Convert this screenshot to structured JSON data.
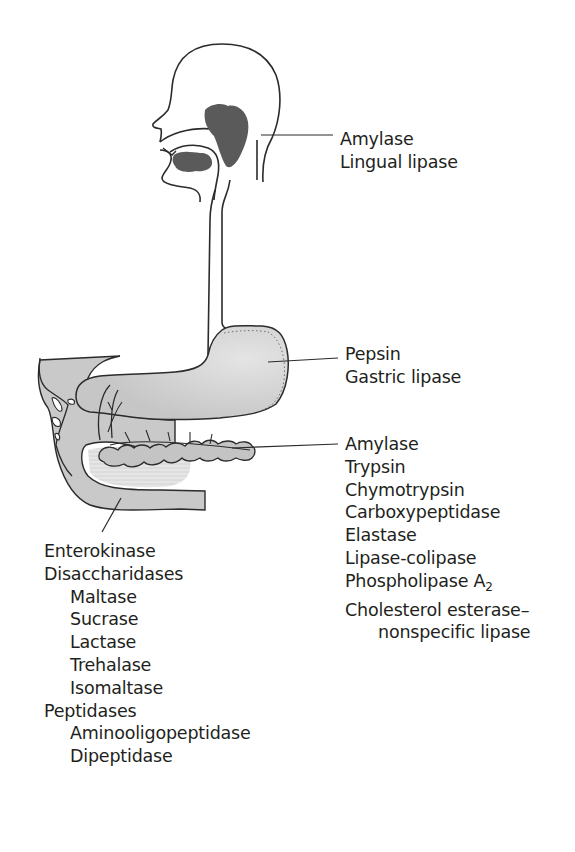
{
  "figure": {
    "type": "labeled anatomical diagram"
  },
  "colors": {
    "outline": "#2b2b2b",
    "gland_fill": "#5a5a5a",
    "organ_fill": "#c9c9c9",
    "organ_light": "#e2e2e2",
    "background": "#ffffff",
    "text": "#231f20"
  },
  "labels": {
    "mouth": {
      "organ": "salivary glands / mouth",
      "items": [
        "Amylase",
        "Lingual lipase"
      ]
    },
    "stomach": {
      "organ": "stomach",
      "items": [
        "Pepsin",
        "Gastric lipase"
      ]
    },
    "pancreas": {
      "organ": "pancreas",
      "items": [
        "Amylase",
        "Trypsin",
        "Chymotrypsin",
        "Carboxypeptidase",
        "Elastase",
        "Lipase-colipase",
        "Phospholipase A",
        "Cholesterol esterase–",
        "nonspecific lipase"
      ],
      "phospholipase_subscript": "2"
    },
    "small_intestine": {
      "organ": "small intestine",
      "items": [
        "Enterokinase",
        "Disaccharidases",
        "Maltase",
        "Sucrase",
        "Lactase",
        "Trehalase",
        "Isomaltase",
        "Peptidases",
        "Aminooligopeptidase",
        "Dipeptidase"
      ]
    }
  }
}
